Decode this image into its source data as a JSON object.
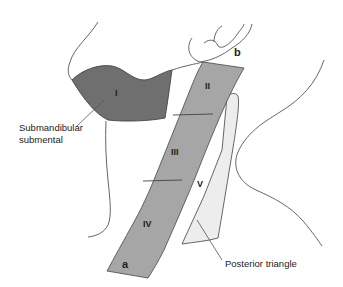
{
  "figure": {
    "levels": [
      {
        "id": "I",
        "label": "I",
        "color": "#6f6f6f"
      },
      {
        "id": "II",
        "label": "II",
        "color": "#a6a6a6"
      },
      {
        "id": "III",
        "label": "III",
        "color": "#a6a6a6"
      },
      {
        "id": "IV",
        "label": "IV",
        "color": "#a6a6a6"
      },
      {
        "id": "V",
        "label": "V",
        "color": "#ededed"
      }
    ],
    "markers": {
      "a": "a",
      "b": "b"
    },
    "captions": {
      "level_I_line1": "Submandibular",
      "level_I_line2": "submental",
      "level_V": "Posterior triangle"
    },
    "colors": {
      "outline": "#555555",
      "background": "#ffffff"
    }
  }
}
